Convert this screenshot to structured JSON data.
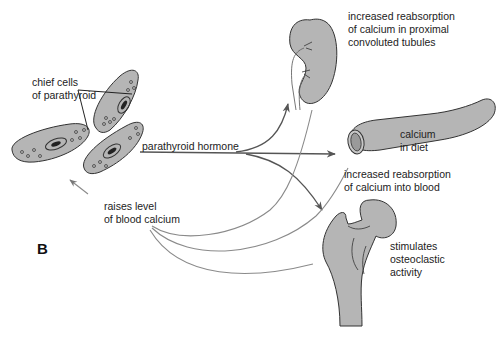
{
  "figure": {
    "panel_label": "B",
    "colors": {
      "organ_fill": "#b5b5b5",
      "outline": "#333333",
      "arrow": "#555555",
      "feedback_line": "#8a8a8a",
      "background": "#ffffff"
    }
  },
  "labels": {
    "chief_cells": [
      "chief cells",
      "of parathyroid"
    ],
    "hormone": "parathyroid hormone",
    "feedback": [
      "raises level",
      "of blood calcium"
    ],
    "kidney": [
      "increased reabsorption",
      "of calcium in proximal",
      "convoluted tubules"
    ],
    "intestine_inner": [
      "calcium",
      "in diet"
    ],
    "intestine": [
      "increased reabsorption",
      "of calcium into blood"
    ],
    "bone": [
      "stimulates",
      "osteoclastic",
      "activity"
    ]
  },
  "structures": [
    {
      "name": "parathyroid-chief-cells"
    },
    {
      "name": "kidney"
    },
    {
      "name": "intestine"
    },
    {
      "name": "femur-bone"
    }
  ]
}
